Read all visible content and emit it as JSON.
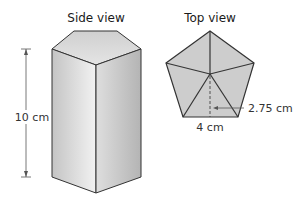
{
  "side_view": {
    "title": "Side view",
    "height_label": "10 cm",
    "shape": "pentagonal prism"
  },
  "top_view": {
    "title": "Top view",
    "side_label": "4 cm",
    "apothem_label": "2.75 cm",
    "shape": "regular pentagon"
  },
  "colors": {
    "fill_light": "#e6e6e6",
    "fill_dark": "#b9b9b9",
    "pentagon_fill": "#cfcfcf",
    "stroke": "#333333"
  }
}
